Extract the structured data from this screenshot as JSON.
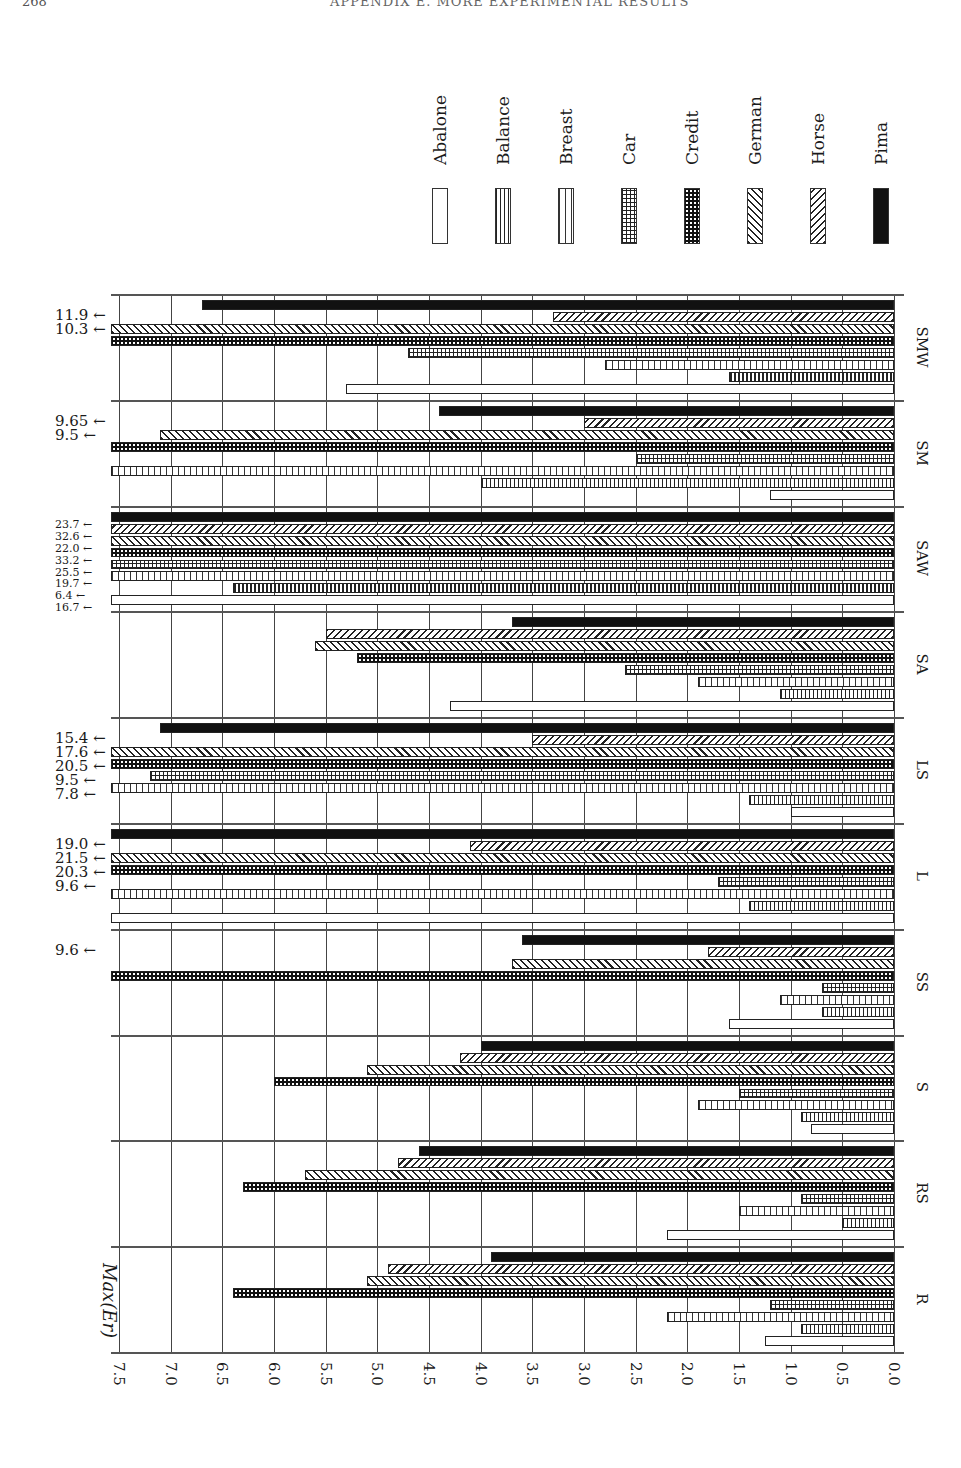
{
  "page": {
    "number": "268",
    "running_head": "APPENDIX E. MORE EXPERIMENTAL RESULTS"
  },
  "chart_data": {
    "type": "bar",
    "orientation": "horizontal (rotated page)",
    "title": "",
    "ylabel": "Max(E_r)",
    "axis_title_display": "Max(Er)",
    "xlabel": "",
    "ylim": [
      0.0,
      7.5
    ],
    "ticks": [
      "7.5",
      "7.0",
      "6.5",
      "6.0",
      "5.5",
      "5.0",
      "4.5",
      "4.0",
      "3.5",
      "3.0",
      "2.5",
      "2.0",
      "1.5",
      "1.0",
      "0.5",
      "0.0"
    ],
    "grid": true,
    "legend_position": "top-right",
    "legend": [
      "Abalone",
      "Balance",
      "Breast",
      "Car",
      "Credit",
      "German",
      "Horse",
      "Pima"
    ],
    "categories": [
      "SMW",
      "SM",
      "SAW",
      "SA",
      "LS",
      "L",
      "SS",
      "S",
      "RS",
      "R"
    ],
    "series": [
      {
        "name": "Abalone",
        "values": [
          5.3,
          1.2,
          16.7,
          4.3,
          1.0,
          9.6,
          1.6,
          0.8,
          2.2,
          1.25
        ]
      },
      {
        "name": "Balance",
        "values": [
          1.6,
          4.0,
          6.4,
          1.1,
          1.4,
          1.4,
          0.7,
          0.9,
          0.5,
          0.9
        ]
      },
      {
        "name": "Breast",
        "values": [
          2.8,
          9.5,
          19.7,
          1.9,
          20.5,
          20.3,
          1.1,
          1.9,
          1.5,
          2.2
        ]
      },
      {
        "name": "Car",
        "values": [
          4.7,
          2.5,
          25.5,
          2.6,
          7.2,
          1.7,
          0.7,
          1.5,
          0.9,
          1.2
        ]
      },
      {
        "name": "Credit",
        "values": [
          10.3,
          9.65,
          33.2,
          5.2,
          17.6,
          21.5,
          9.6,
          6.0,
          6.3,
          6.4
        ]
      },
      {
        "name": "German",
        "values": [
          11.9,
          7.1,
          22.0,
          5.6,
          15.4,
          19.0,
          3.7,
          5.1,
          5.7,
          5.1
        ]
      },
      {
        "name": "Horse",
        "values": [
          3.3,
          3.0,
          32.6,
          5.5,
          3.5,
          4.1,
          1.8,
          4.2,
          4.8,
          4.9
        ]
      },
      {
        "name": "Pima",
        "values": [
          6.7,
          4.4,
          23.7,
          3.7,
          7.1,
          7.8,
          3.6,
          4.0,
          4.6,
          3.9
        ]
      }
    ],
    "overflow_annotations": [
      {
        "group": "SMW",
        "labels": [
          "11.9",
          "10.3"
        ]
      },
      {
        "group": "SM",
        "labels": [
          "9.65",
          "9.5"
        ]
      },
      {
        "group": "SAW",
        "labels": [
          "23.7",
          "32.6",
          "22.0",
          "33.2",
          "25.5",
          "19.7",
          "6.4",
          "16.7"
        ]
      },
      {
        "group": "LS",
        "labels": [
          "15.4",
          "17.6",
          "20.5",
          "9.5",
          "7.8"
        ]
      },
      {
        "group": "L",
        "labels": [
          "19.0",
          "21.5",
          "20.3",
          "9.6"
        ]
      },
      {
        "group": "SS",
        "labels": [
          "9.6"
        ]
      }
    ]
  },
  "legend_items": [
    {
      "label": "Abalone",
      "pattern": "empty"
    },
    {
      "label": "Balance",
      "pattern": "dense-vertical"
    },
    {
      "label": "Breast",
      "pattern": "sparse-vertical"
    },
    {
      "label": "Car",
      "pattern": "grid"
    },
    {
      "label": "Credit",
      "pattern": "dark-dotted"
    },
    {
      "label": "German",
      "pattern": "back-diagonal"
    },
    {
      "label": "Horse",
      "pattern": "forward-diagonal"
    },
    {
      "label": "Pima",
      "pattern": "solid-black"
    }
  ]
}
